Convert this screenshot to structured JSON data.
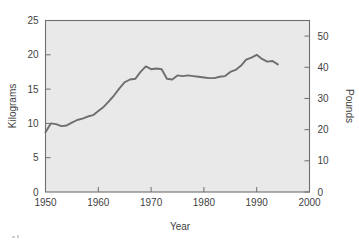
{
  "chart_data": {
    "type": "line",
    "title": "",
    "xlabel": "Year",
    "ylabel": "Kilograms",
    "y2label": "Pounds",
    "xlim": [
      1950,
      2000
    ],
    "ylim": [
      0,
      25
    ],
    "y2lim": [
      0,
      55
    ],
    "grid": false,
    "legend": false,
    "background": "#e9e9e9",
    "line_color": "#6e6e6e",
    "xticks": [
      1950,
      1960,
      1970,
      1980,
      1990,
      2000
    ],
    "xtick_labels": [
      "1950",
      "1960",
      "1970",
      "1980",
      "1990",
      "2000"
    ],
    "yticks": [
      0,
      5,
      10,
      15,
      20,
      25
    ],
    "ytick_labels": [
      "0",
      "5",
      "10",
      "15",
      "20",
      "25"
    ],
    "y2ticks": [
      0,
      10,
      20,
      30,
      40,
      50
    ],
    "y2tick_labels": [
      "0",
      "10",
      "20",
      "30",
      "40",
      "50"
    ],
    "series": [
      {
        "name": "Consumption",
        "units": "kilograms",
        "x": [
          1950,
          1951,
          1952,
          1953,
          1954,
          1955,
          1956,
          1957,
          1958,
          1959,
          1960,
          1961,
          1962,
          1963,
          1964,
          1965,
          1966,
          1967,
          1968,
          1969,
          1970,
          1971,
          1972,
          1973,
          1974,
          1975,
          1976,
          1977,
          1978,
          1979,
          1980,
          1981,
          1982,
          1983,
          1984,
          1985,
          1986,
          1987,
          1988,
          1989,
          1990,
          1991,
          1992,
          1993,
          1994
        ],
        "values": [
          8.7,
          10.0,
          9.9,
          9.6,
          9.7,
          10.1,
          10.5,
          10.7,
          11.0,
          11.2,
          11.8,
          12.4,
          13.2,
          14.1,
          15.1,
          16.0,
          16.4,
          16.5,
          17.5,
          18.3,
          17.9,
          18.0,
          17.9,
          16.5,
          16.4,
          17.0,
          16.9,
          17.0,
          16.9,
          16.8,
          16.7,
          16.6,
          16.6,
          16.8,
          16.9,
          17.5,
          17.8,
          18.4,
          19.3,
          19.6,
          20.0,
          19.4,
          19.0,
          19.1,
          18.6
        ]
      }
    ]
  },
  "axes": {
    "x_title": "Year",
    "y_left_title": "Kilograms",
    "y_right_title": "Pounds"
  }
}
